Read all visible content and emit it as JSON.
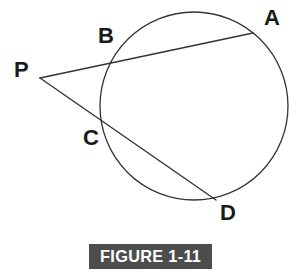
{
  "figure": {
    "caption": "FIGURE 1-11",
    "caption_bg_color": "#4d4d4d",
    "caption_text_color": "#ffffff",
    "stroke_color": "#333333",
    "background_color": "#ffffff",
    "labels": {
      "A": "A",
      "B": "B",
      "C": "C",
      "D": "D",
      "P": "P"
    },
    "geometry": {
      "circle": {
        "cx": 194,
        "cy": 106,
        "r": 94
      },
      "points": {
        "P": {
          "x": 40,
          "y": 78
        },
        "A": {
          "x": 253,
          "y": 33
        },
        "B": {
          "x": 118,
          "y": 60
        },
        "C": {
          "x": 104,
          "y": 125
        },
        "D": {
          "x": 216,
          "y": 200
        }
      },
      "secants": [
        {
          "name": "PBA",
          "from": "P",
          "through": "B",
          "to": "A"
        },
        {
          "name": "PCD",
          "from": "P",
          "through": "C",
          "to": "D"
        }
      ]
    }
  }
}
